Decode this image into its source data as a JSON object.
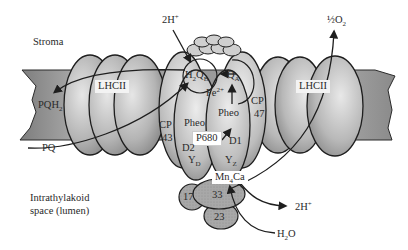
{
  "regions": {
    "stroma": "Stroma",
    "lumen_line1": "Intrathylakoid",
    "lumen_line2": "space (lumen)"
  },
  "complexes": {
    "lhcii_left": "LHCII",
    "lhcii_right": "LHCII",
    "cp43_line1": "CP",
    "cp43_line2": "43",
    "cp47_line1": "CP",
    "cp47_line2": "47",
    "d1": "D1",
    "d2": "D2",
    "p680": "P680",
    "pheo_left": "Pheo",
    "pheo_right": "Pheo",
    "ext_17": "17",
    "ext_33": "33",
    "ext_23": "23"
  },
  "cofactors": {
    "qb": {
      "main": "H",
      "sub1": "2",
      "mid": "Q",
      "sub2": "B"
    },
    "qa": {
      "main": "Q",
      "sub": "A"
    },
    "fe": {
      "main": "Fe",
      "sup": "2+"
    },
    "yd": {
      "main": "Y",
      "sub": "D"
    },
    "yz": {
      "main": "Y",
      "sub": "Z"
    },
    "mn": {
      "main": "Mn",
      "sub": "4",
      "tail": "Ca"
    }
  },
  "pool": {
    "pqh2": {
      "main": "PQH",
      "sub": "2"
    },
    "pq": "PQ"
  },
  "reactants": {
    "h_in": {
      "main": "2H",
      "sup": "+"
    },
    "o2": {
      "main": "½O",
      "sub": "2"
    },
    "h_out": {
      "main": "2H",
      "sup": "+"
    },
    "h2o": {
      "main": "H",
      "sub": "2",
      "tail": "O"
    }
  },
  "colors": {
    "membrane": "#8a8a8a",
    "protein_light": "#d8d8d8",
    "protein_dark": "#8c8c8c",
    "extrinsic": "#a6a6a6",
    "outline": "#1e1e1e",
    "background": "#ffffff"
  }
}
